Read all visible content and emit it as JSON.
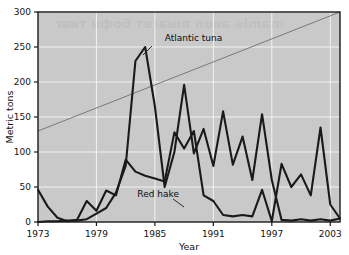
{
  "chart_data": {
    "type": "line",
    "title": "",
    "xlabel": "Year",
    "ylabel": "Metric tons",
    "xlim": [
      1973,
      2004
    ],
    "ylim": [
      0,
      300
    ],
    "xticks": [
      "1973",
      "1979",
      "1985",
      "1991",
      "1997",
      "2003"
    ],
    "xtick_values": [
      1973,
      1979,
      1985,
      1991,
      1997,
      2003
    ],
    "yticks": [
      "0",
      "50",
      "100",
      "150",
      "200",
      "250",
      "300"
    ],
    "ytick_values": [
      0,
      50,
      100,
      150,
      200,
      250,
      300
    ],
    "grid": "horizontal-and-vertical-white-gridlines",
    "legend": "inline-annotations",
    "x": [
      1973,
      1974,
      1975,
      1976,
      1977,
      1978,
      1979,
      1980,
      1981,
      1982,
      1983,
      1984,
      1985,
      1986,
      1987,
      1988,
      1989,
      1990,
      1991,
      1992,
      1993,
      1994,
      1995,
      1996,
      1997,
      1998,
      1999,
      2000,
      2001,
      2002,
      2003,
      2004
    ],
    "series": [
      {
        "name": "Atlantic tuna",
        "label": "Atlantic tuna",
        "color": "#1a1a1a",
        "values": [
          0,
          1,
          1,
          2,
          2,
          4,
          12,
          20,
          42,
          80,
          230,
          250,
          165,
          50,
          100,
          196,
          98,
          133,
          80,
          158,
          82,
          122,
          60,
          154,
          60,
          3,
          2,
          4,
          2,
          4,
          2,
          5
        ]
      },
      {
        "name": "Red hake",
        "label": "Red hake",
        "color": "#1a1a1a",
        "values": [
          46,
          22,
          6,
          1,
          3,
          30,
          16,
          45,
          38,
          89,
          72,
          66,
          62,
          58,
          128,
          105,
          130,
          38,
          30,
          10,
          8,
          10,
          8,
          46,
          1,
          83,
          50,
          68,
          38,
          135,
          25,
          5
        ]
      }
    ],
    "trend_line": {
      "name": "trend-line",
      "color": "#6e6e6e",
      "x_start": 1973,
      "y_start": 130,
      "x_end": 2004,
      "y_end": 302
    },
    "annotations": [
      {
        "text": "Atlantic tuna",
        "x": 1986.0,
        "y": 258
      },
      {
        "text": "Red hake",
        "x": 1983.2,
        "y": 36
      }
    ],
    "background_color": "#c9c9c9",
    "plot_border_color": "#1a1a1a",
    "gridline_color": "#f2f2f2"
  },
  "ghost_bleed": {
    "line1": "ınamie авол пшагет бофн тивг"
  },
  "accessibility": {
    "figure_role": "line-chart",
    "summary": "Metric tons of Atlantic tuna and Red hake by year, 1973 to 2003"
  }
}
